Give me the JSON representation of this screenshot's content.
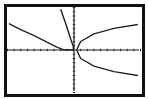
{
  "chart_data": {
    "type": "line",
    "title": "",
    "xlabel": "",
    "ylabel": "",
    "xlim": [
      -10,
      10
    ],
    "ylim": [
      -10,
      10
    ],
    "xscl": 1,
    "yscl": 1,
    "grid": false,
    "axes": true,
    "series": [
      {
        "name": "left-decreasing-curve",
        "points": [
          [
            -9.8,
            6.2
          ],
          [
            -8,
            4.8
          ],
          [
            -6,
            3.4
          ],
          [
            -4,
            1.8
          ],
          [
            -2.5,
            0.6
          ],
          [
            -1.5,
            0.05
          ],
          [
            0,
            0
          ]
        ]
      },
      {
        "name": "steep-curve-near-origin",
        "points": [
          [
            -2,
            9.6
          ],
          [
            -1.2,
            6
          ],
          [
            -0.5,
            2.6
          ],
          [
            -0.1,
            0.8
          ],
          [
            -0.1,
            0
          ]
        ]
      },
      {
        "name": "sideways-parabola-upper",
        "points": [
          [
            0.4,
            0
          ],
          [
            1,
            2
          ],
          [
            3,
            3.8
          ],
          [
            6,
            5.1
          ],
          [
            9.6,
            6
          ]
        ]
      },
      {
        "name": "sideways-parabola-lower",
        "points": [
          [
            0.4,
            0
          ],
          [
            1,
            -2
          ],
          [
            3,
            -3.8
          ],
          [
            6,
            -5.1
          ],
          [
            9.6,
            -6
          ]
        ]
      }
    ],
    "legend": null
  },
  "screen": {
    "frame_color": "#111111",
    "background": "#ffffff",
    "curve_color": "#222222",
    "axis_color": "#222222"
  }
}
